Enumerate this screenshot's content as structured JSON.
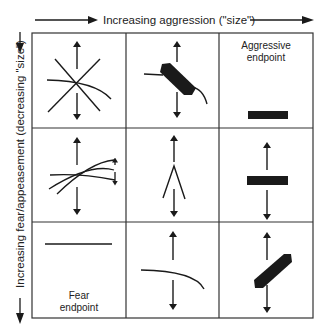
{
  "figure": {
    "x_axis_label": "Increasing aggression (\"size\")",
    "y_axis_label": "Increasing fear/appeasement (decreasing \"size\")",
    "grid": {
      "rows": 3,
      "cols": 3
    },
    "cells": [
      {
        "row": 0,
        "col": 0,
        "glyph": "crossed-lines-with-curve",
        "has_arrows": true,
        "text": []
      },
      {
        "row": 0,
        "col": 1,
        "glyph": "diagonal-thick-bar-with-curve",
        "has_arrows": true,
        "text": []
      },
      {
        "row": 0,
        "col": 2,
        "glyph": "horizontal-thick-bar",
        "has_arrows": false,
        "text": [
          "Aggressive",
          "endpoint"
        ]
      },
      {
        "row": 1,
        "col": 0,
        "glyph": "converging-curves-with-small-arrows",
        "has_arrows": true,
        "text": []
      },
      {
        "row": 1,
        "col": 1,
        "glyph": "inverted-v",
        "has_arrows": true,
        "text": []
      },
      {
        "row": 1,
        "col": 2,
        "glyph": "horizontal-thick-bar",
        "has_arrows": true,
        "text": []
      },
      {
        "row": 2,
        "col": 0,
        "glyph": "horizontal-thin-line",
        "has_arrows": false,
        "text": [
          "Fear",
          "endpoint"
        ]
      },
      {
        "row": 2,
        "col": 1,
        "glyph": "curved-line",
        "has_arrows": true,
        "text": []
      },
      {
        "row": 2,
        "col": 2,
        "glyph": "diagonal-thick-bar-rising",
        "has_arrows": true,
        "text": []
      }
    ],
    "colors": {
      "ink": "#1a1a1a",
      "grid": "#333333",
      "background": "#ffffff"
    }
  }
}
